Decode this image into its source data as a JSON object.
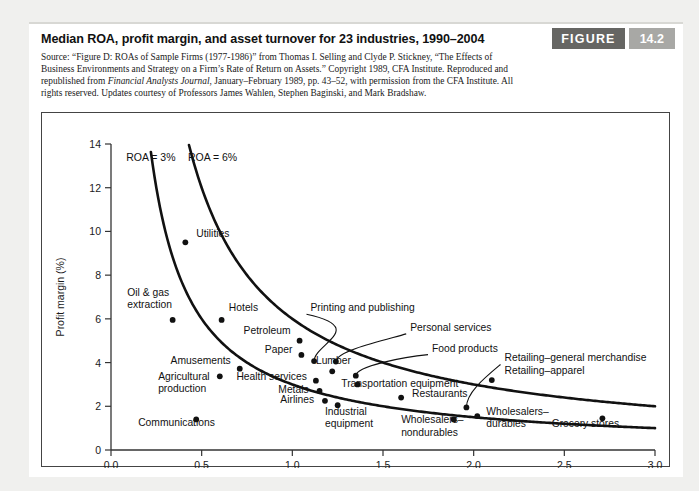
{
  "figure": {
    "title": "Median ROA, profit margin, and asset turnover for 23 industries, 1990–2004",
    "badge_label": "FIGURE",
    "badge_number": "14.2",
    "source_part1": "Source: “Figure D: ROAs of Sample Firms (1977-1986)” from Thomas I. Selling and Clyde P. Stickney, “The Effects of Business Environments and Strategy on a Firm’s Rate of Return on Assets.” Copyright 1989, CFA Institute. Reproduced and republished from ",
    "source_italic": "Financial Analysts Journal",
    "source_part2": ", January–February 1989, pp. 43–52, with permission from the CFA Institute. All rights reserved. Updates courtesy of Professors James Wahlen, Stephen Baginski, and Mark Bradshaw."
  },
  "chart_data": {
    "type": "scatter",
    "title": "Median ROA, profit margin, and asset turnover for 23 industries, 1990–2004",
    "xlabel": "Asset turnover",
    "ylabel": "Profit margin (%)",
    "xlim": [
      0.0,
      3.0
    ],
    "ylim": [
      0,
      14
    ],
    "xticks": [
      0.0,
      0.5,
      1.0,
      1.5,
      2.0,
      2.5,
      3.0
    ],
    "xtick_labels": [
      "0.0",
      "0.5",
      "1.0",
      "1.5",
      "2.0",
      "2.5",
      "3.0"
    ],
    "yticks": [
      0,
      2,
      4,
      6,
      8,
      10,
      12,
      14
    ],
    "ytick_labels": [
      "0",
      "2",
      "4",
      "6",
      "8",
      "10",
      "12",
      "14"
    ],
    "grid": false,
    "legend": "none",
    "marker_color": "#111111",
    "curve_color": "#111111",
    "curves": [
      {
        "name": "ROA = 3%",
        "roa": 3,
        "label": "ROA = 3%",
        "label_x": 0.22,
        "label_y": 13.2
      },
      {
        "name": "ROA = 6%",
        "roa": 6,
        "label": "ROA = 6%",
        "label_x": 0.56,
        "label_y": 13.2
      }
    ],
    "points": [
      {
        "label": "Utilities",
        "x": 0.41,
        "y": 9.5,
        "lx": 0.47,
        "ly": 9.75,
        "anchor": "start",
        "leader": false
      },
      {
        "label": "Oil & gas\nextraction",
        "x": 0.34,
        "y": 5.95,
        "lx": 0.09,
        "ly": 7.05,
        "anchor": "start",
        "leader": false
      },
      {
        "label": "Hotels",
        "x": 0.61,
        "y": 5.95,
        "lx": 0.65,
        "ly": 6.35,
        "anchor": "start",
        "leader": false
      },
      {
        "label": "Petroleum",
        "x": 1.04,
        "y": 5.0,
        "lx": 0.99,
        "ly": 5.3,
        "anchor": "end",
        "leader": false
      },
      {
        "label": "Paper",
        "x": 1.05,
        "y": 4.35,
        "lx": 1.0,
        "ly": 4.45,
        "anchor": "end",
        "leader": false
      },
      {
        "label": "Amusements",
        "x": 0.71,
        "y": 3.72,
        "lx": 0.66,
        "ly": 3.95,
        "anchor": "end",
        "leader": false
      },
      {
        "label": "Lumber",
        "x": 1.22,
        "y": 3.6,
        "lx": 1.13,
        "ly": 3.95,
        "anchor": "start",
        "leader": false
      },
      {
        "label": "Agricultural\nproduction",
        "x": 0.6,
        "y": 3.37,
        "lx": 0.26,
        "ly": 3.2,
        "anchor": "start",
        "leader": false
      },
      {
        "label": "Health services",
        "x": 1.13,
        "y": 3.17,
        "lx": 1.08,
        "ly": 3.22,
        "anchor": "end",
        "leader": false
      },
      {
        "label": "Metals",
        "x": 1.15,
        "y": 2.7,
        "lx": 1.09,
        "ly": 2.63,
        "anchor": "end",
        "leader": false
      },
      {
        "label": "Airlines",
        "x": 1.18,
        "y": 2.25,
        "lx": 1.12,
        "ly": 2.17,
        "anchor": "end",
        "leader": false
      },
      {
        "label": "Industrial\nequipment",
        "x": 1.25,
        "y": 2.05,
        "lx": 1.18,
        "ly": 1.6,
        "anchor": "start",
        "leader": false
      },
      {
        "label": "Communications",
        "x": 0.47,
        "y": 1.4,
        "lx": 0.15,
        "ly": 1.1,
        "anchor": "start",
        "leader": false
      },
      {
        "label": "Printing and publishing",
        "x": 1.12,
        "y": 4.07,
        "lx": 1.1,
        "ly": 6.35,
        "anchor": "start",
        "leader": true,
        "bend_x": 1.42,
        "bend_y": 5.6
      },
      {
        "label": "Personal services",
        "x": 1.24,
        "y": 4.05,
        "lx": 1.65,
        "ly": 5.45,
        "anchor": "start",
        "leader": true,
        "bend_x": 1.52,
        "bend_y": 5.05
      },
      {
        "label": "Food products",
        "x": 1.35,
        "y": 3.4,
        "lx": 1.77,
        "ly": 4.5,
        "anchor": "start",
        "leader": true,
        "bend_x": 1.62,
        "bend_y": 4.27
      },
      {
        "label": "Transportation equipment",
        "x": 1.36,
        "y": 3.0,
        "lx": 1.27,
        "ly": 2.88,
        "anchor": "start",
        "leader": false
      },
      {
        "label": "Restaurants",
        "x": 1.6,
        "y": 2.4,
        "lx": 1.66,
        "ly": 2.42,
        "anchor": "start",
        "leader": false
      },
      {
        "label": "Retailing–general merchandise",
        "x": 1.96,
        "y": 1.95,
        "lx": 2.17,
        "ly": 4.05,
        "anchor": "start",
        "leader": true,
        "bend_x": 2.06,
        "bend_y": 3.3
      },
      {
        "label": "Retailing–apparel",
        "x": 2.1,
        "y": 3.2,
        "lx": 2.17,
        "ly": 3.5,
        "anchor": "start",
        "leader": false
      },
      {
        "label": "Wholesalers–\nnondurables",
        "x": 1.89,
        "y": 1.4,
        "lx": 1.6,
        "ly": 1.22,
        "anchor": "start",
        "leader": false
      },
      {
        "label": "Wholesalers–\ndurables",
        "x": 2.02,
        "y": 1.55,
        "lx": 2.07,
        "ly": 1.6,
        "anchor": "start",
        "leader": false
      },
      {
        "label": "Grocery stores",
        "x": 2.71,
        "y": 1.45,
        "lx": 2.43,
        "ly": 1.03,
        "anchor": "start",
        "leader": false
      }
    ]
  }
}
